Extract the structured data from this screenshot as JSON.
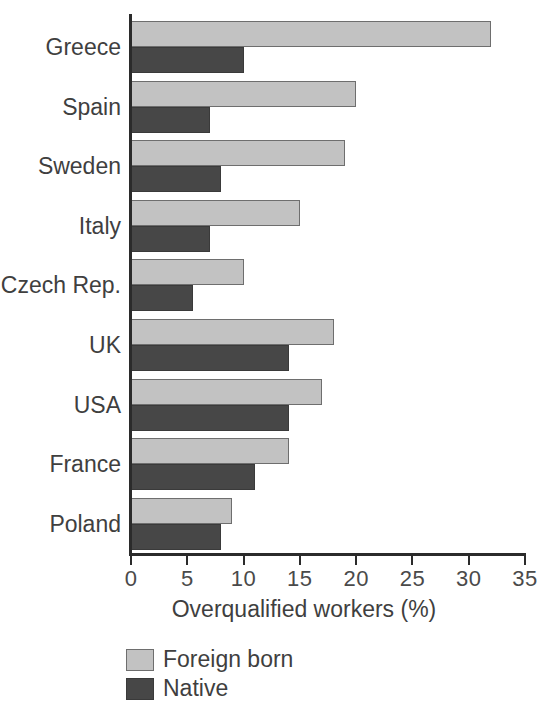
{
  "chart_data": {
    "type": "bar",
    "orientation": "horizontal",
    "title": "",
    "xlabel": "Overqualified workers (%)",
    "ylabel": "",
    "xlim": [
      0,
      35
    ],
    "xticks": [
      0,
      5,
      10,
      15,
      20,
      25,
      30,
      35
    ],
    "xtick_labels": [
      "0",
      "5",
      "10",
      "15",
      "20",
      "25",
      "30",
      "35"
    ],
    "grid": false,
    "legend_position": "below-left",
    "categories": [
      "Greece",
      "Spain",
      "Sweden",
      "Italy",
      "Czech Rep.",
      "UK",
      "USA",
      "France",
      "Poland"
    ],
    "series": [
      {
        "name": "Foreign born",
        "color": "#c2c2c2",
        "values": [
          32,
          20,
          19,
          15,
          10,
          18,
          17,
          14,
          9
        ]
      },
      {
        "name": "Native",
        "color": "#474747",
        "values": [
          10,
          7,
          8,
          7,
          5.5,
          14,
          14,
          11,
          8
        ]
      }
    ]
  },
  "legend": {
    "items": [
      {
        "label": "Foreign born",
        "swatch": "foreign"
      },
      {
        "label": "Native",
        "swatch": "native"
      }
    ]
  },
  "axis_title": "Overqualified workers (%)"
}
